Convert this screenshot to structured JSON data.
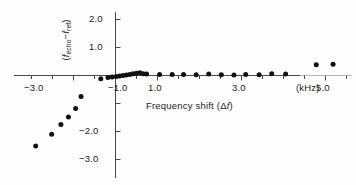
{
  "chart_data": {
    "type": "scatter",
    "title": "",
    "xlabel": "Frequency shift (Δf)",
    "xunit": "(kHz)",
    "ylabel": "(f echo − f ref)",
    "ylabel_parts": {
      "open": "(",
      "sym1": "f",
      "sub1": "echo",
      "minus": "−",
      "sym2": "f",
      "sub2": "ref",
      "close": ")"
    },
    "xlim": [
      -3.8,
      6.1
    ],
    "ylim": [
      -3.55,
      2.35
    ],
    "xticks": [
      -3.5,
      -3.0,
      -2.5,
      -2.0,
      -1.5,
      -1.0,
      -0.5,
      0.5,
      1.0,
      1.5,
      2.0,
      2.5,
      3.0,
      3.5,
      4.0,
      4.5,
      5.0,
      5.5,
      6.0
    ],
    "xtick_labels": [
      {
        "value": -3.0,
        "text": "−3.0"
      },
      {
        "value": -1.0,
        "text": "−1.0"
      },
      {
        "value": 1.0,
        "text": "1.0"
      },
      {
        "value": 3.0,
        "text": "3.0"
      },
      {
        "value": 5.0,
        "text": "5.0"
      }
    ],
    "yticks": [
      2.0,
      1.0,
      -1.0,
      -2.0,
      -3.0
    ],
    "ytick_labels": [
      {
        "value": 2.0,
        "text": "2.0"
      },
      {
        "value": 1.0,
        "text": "1.0"
      },
      {
        "value": -2.0,
        "text": "−2.0"
      },
      {
        "value": -3.0,
        "text": "−3.0"
      }
    ],
    "grid": false,
    "legend": null,
    "marker": "filled-circle",
    "marker_color": "#111111",
    "points": [
      {
        "x": -1.9,
        "y": -2.52
      },
      {
        "x": -1.52,
        "y": -2.1
      },
      {
        "x": -1.3,
        "y": -1.75
      },
      {
        "x": -1.12,
        "y": -1.48
      },
      {
        "x": -0.95,
        "y": -1.18
      },
      {
        "x": -0.82,
        "y": -0.75
      },
      {
        "x": -0.35,
        "y": -0.12
      },
      {
        "x": -0.18,
        "y": -0.07
      },
      {
        "x": -0.08,
        "y": -0.05
      },
      {
        "x": 0.02,
        "y": -0.04
      },
      {
        "x": 0.1,
        "y": -0.02
      },
      {
        "x": 0.18,
        "y": 0.0
      },
      {
        "x": 0.26,
        "y": 0.02
      },
      {
        "x": 0.34,
        "y": 0.04
      },
      {
        "x": 0.42,
        "y": 0.06
      },
      {
        "x": 0.5,
        "y": 0.08
      },
      {
        "x": 0.58,
        "y": 0.1
      },
      {
        "x": 0.66,
        "y": 0.06
      },
      {
        "x": 0.74,
        "y": 0.05
      },
      {
        "x": 1.05,
        "y": 0.04
      },
      {
        "x": 1.35,
        "y": 0.04
      },
      {
        "x": 1.62,
        "y": 0.04
      },
      {
        "x": 1.92,
        "y": 0.03
      },
      {
        "x": 2.22,
        "y": 0.05
      },
      {
        "x": 2.52,
        "y": 0.03
      },
      {
        "x": 2.82,
        "y": 0.02
      },
      {
        "x": 3.1,
        "y": 0.04
      },
      {
        "x": 3.42,
        "y": 0.03
      },
      {
        "x": 3.72,
        "y": 0.06
      },
      {
        "x": 4.05,
        "y": 0.05
      },
      {
        "x": 4.78,
        "y": 0.38
      },
      {
        "x": 5.18,
        "y": 0.4
      }
    ]
  }
}
